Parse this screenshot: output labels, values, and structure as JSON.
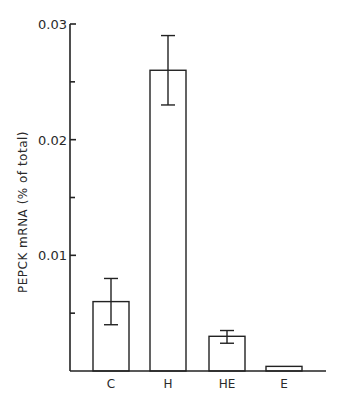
{
  "chart_data": {
    "type": "bar",
    "title": "",
    "xlabel": "",
    "ylabel": "PEPCK  mRNA  (% of total)",
    "ylim": [
      0,
      0.03
    ],
    "yticks": [
      {
        "value": 0.01,
        "label": "0.01"
      },
      {
        "value": 0.02,
        "label": "0.02"
      },
      {
        "value": 0.03,
        "label": "0.03"
      }
    ],
    "minor_yticks": [
      0.005,
      0.015,
      0.025
    ],
    "categories": [
      "C",
      "H",
      "HE",
      "E"
    ],
    "values": [
      0.006,
      0.026,
      0.003,
      0.0004
    ],
    "error_bars": [
      {
        "low": 0.004,
        "high": 0.008
      },
      {
        "low": 0.023,
        "high": 0.029
      },
      {
        "low": 0.0024,
        "high": 0.0035
      },
      {
        "low": 0.0004,
        "high": 0.0004
      }
    ],
    "grid": false,
    "legend": null,
    "bar_fill": "#ffffff",
    "bar_stroke": "#222222"
  }
}
